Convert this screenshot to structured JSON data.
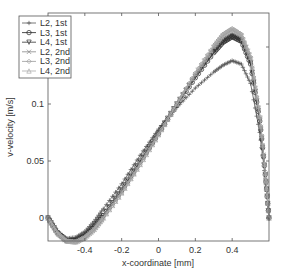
{
  "chart_data": {
    "type": "line",
    "title": "",
    "xlabel": "x-coordinate [mm]",
    "ylabel": "v-velocity [m/s]",
    "xlim": [
      -0.6,
      0.6
    ],
    "ylim": [
      -0.02,
      0.18
    ],
    "x_ticks": [
      -0.4,
      -0.2,
      0,
      0.2,
      0.4
    ],
    "x_tick_labels": [
      "-0.4",
      "-0.2",
      "0",
      "0.2",
      "0.4"
    ],
    "y_ticks": [
      0,
      0.05,
      0.1,
      0.15
    ],
    "y_tick_labels": [
      "0",
      "0.05",
      "0.1",
      ""
    ],
    "grid": false,
    "legend_position": "upper left",
    "x": [
      -0.6,
      -0.55,
      -0.5,
      -0.45,
      -0.4,
      -0.35,
      -0.3,
      -0.2,
      -0.1,
      0,
      0.1,
      0.2,
      0.3,
      0.35,
      0.4,
      0.45,
      0.5,
      0.55,
      0.58,
      0.6
    ],
    "series": [
      {
        "name": "L2, 1st",
        "marker": "+",
        "color": "#555555",
        "values": [
          0,
          -0.012,
          -0.018,
          -0.017,
          -0.012,
          -0.003,
          0.008,
          0.03,
          0.055,
          0.078,
          0.097,
          0.114,
          0.128,
          0.134,
          0.138,
          0.135,
          0.118,
          0.075,
          0.035,
          0
        ]
      },
      {
        "name": "L3, 1st",
        "marker": "o",
        "color": "#222222",
        "values": [
          0,
          -0.013,
          -0.02,
          -0.02,
          -0.016,
          -0.008,
          0.002,
          0.024,
          0.049,
          0.074,
          0.099,
          0.123,
          0.145,
          0.154,
          0.159,
          0.155,
          0.135,
          0.085,
          0.038,
          0
        ]
      },
      {
        "name": "L4, 1st",
        "marker": "v",
        "color": "#333333",
        "values": [
          0,
          -0.013,
          -0.02,
          -0.02,
          -0.016,
          -0.008,
          0.002,
          0.025,
          0.05,
          0.075,
          0.1,
          0.124,
          0.146,
          0.155,
          0.16,
          0.156,
          0.136,
          0.086,
          0.038,
          0
        ]
      },
      {
        "name": "L2, 2nd",
        "marker": "x",
        "color": "#888888",
        "values": [
          0,
          -0.013,
          -0.02,
          -0.021,
          -0.017,
          -0.01,
          0.0,
          0.022,
          0.047,
          0.073,
          0.1,
          0.126,
          0.15,
          0.16,
          0.165,
          0.16,
          0.14,
          0.088,
          0.039,
          0
        ]
      },
      {
        "name": "L3, 2nd",
        "marker": "diamond",
        "color": "#999999",
        "values": [
          0,
          -0.013,
          -0.02,
          -0.021,
          -0.017,
          -0.01,
          0.0,
          0.022,
          0.047,
          0.073,
          0.1,
          0.127,
          0.151,
          0.161,
          0.166,
          0.161,
          0.141,
          0.089,
          0.039,
          0
        ]
      },
      {
        "name": "L4, 2nd",
        "marker": "^",
        "color": "#aaaaaa",
        "values": [
          0,
          -0.013,
          -0.02,
          -0.021,
          -0.017,
          -0.01,
          0.0,
          0.022,
          0.047,
          0.073,
          0.1,
          0.127,
          0.151,
          0.161,
          0.166,
          0.161,
          0.141,
          0.089,
          0.039,
          0
        ]
      }
    ]
  },
  "legend": {
    "items": [
      {
        "label": "L2, 1st"
      },
      {
        "label": "L3, 1st"
      },
      {
        "label": "L4, 1st"
      },
      {
        "label": "L2, 2nd"
      },
      {
        "label": "L3, 2nd"
      },
      {
        "label": "L4, 2nd"
      }
    ]
  }
}
